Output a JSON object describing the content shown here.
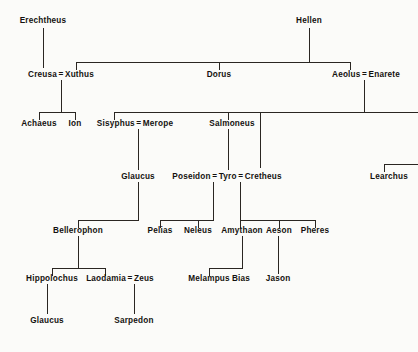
{
  "diagram": {
    "type": "family-tree",
    "ink_color": "#2a2622",
    "paper_color": "#fbfbf9",
    "union_symbol": "=",
    "generations": [
      {
        "row": 1,
        "y": 22,
        "people": [
          {
            "name": "Erechtheus",
            "x": 43
          },
          {
            "name": "Hellen",
            "x": 309
          }
        ]
      },
      {
        "row": 2,
        "y": 76,
        "people": [
          {
            "name": "Creusa",
            "x": 46
          },
          {
            "name": "Xuthus",
            "x": 76
          },
          {
            "name": "Dorus",
            "x": 219
          },
          {
            "name": "Aeolus",
            "x": 350
          },
          {
            "name": "Enarete",
            "x": 383
          }
        ],
        "unions": [
          {
            "left": "Creusa",
            "right": "Xuthus"
          },
          {
            "left": "Aeolus",
            "right": "Enarete"
          }
        ]
      },
      {
        "row": 3,
        "y": 125,
        "people": [
          {
            "name": "Achaeus",
            "x": 39
          },
          {
            "name": "Ion",
            "x": 75
          },
          {
            "name": "Sisyphus",
            "x": 114
          },
          {
            "name": "Merope",
            "x": 153
          },
          {
            "name": "Salmoneus",
            "x": 232
          }
        ],
        "unions": [
          {
            "left": "Sisyphus",
            "right": "Merope"
          }
        ]
      },
      {
        "row": 4,
        "y": 178,
        "people": [
          {
            "name": "Glaucus",
            "x": 138
          },
          {
            "name": "Poseidon",
            "x": 196
          },
          {
            "name": "Tyro",
            "x": 227
          },
          {
            "name": "Cretheus",
            "x": 256
          },
          {
            "name": "Learchus",
            "x": 389
          }
        ],
        "unions": [
          {
            "left": "Poseidon",
            "right": "Tyro"
          },
          {
            "left": "Tyro",
            "right": "Cretheus"
          }
        ]
      },
      {
        "row": 5,
        "y": 232,
        "people": [
          {
            "name": "Bellerophon",
            "x": 78
          },
          {
            "name": "Pelias",
            "x": 160
          },
          {
            "name": "Neleus",
            "x": 198
          },
          {
            "name": "Amythaon",
            "x": 242
          },
          {
            "name": "Aeson",
            "x": 279
          },
          {
            "name": "Pheres",
            "x": 315
          }
        ]
      },
      {
        "row": 6,
        "y": 280,
        "people": [
          {
            "name": "Hippolochus",
            "x": 52
          },
          {
            "name": "Laodamia",
            "x": 105
          },
          {
            "name": "Zeus",
            "x": 141
          },
          {
            "name": "Melampus",
            "x": 209
          },
          {
            "name": "Bias",
            "x": 241
          },
          {
            "name": "Jason",
            "x": 278
          }
        ],
        "unions": [
          {
            "left": "Laodamia",
            "right": "Zeus"
          }
        ]
      },
      {
        "row": 7,
        "y": 322,
        "people": [
          {
            "name": "Glaucus",
            "x": 47
          },
          {
            "name": "Sarpedon",
            "x": 134
          }
        ]
      }
    ],
    "labels": {
      "erechtheus": "Erechtheus",
      "hellen": "Hellen",
      "creusa": "Creusa",
      "xuthus": "Xuthus",
      "dorus": "Dorus",
      "aeolus": "Aeolus",
      "enarete": "Enarete",
      "achaeus": "Achaeus",
      "ion": "Ion",
      "sisyphus": "Sisyphus",
      "merope": "Merope",
      "salmoneus": "Salmoneus",
      "glaucus_mid": "Glaucus",
      "poseidon": "Poseidon",
      "tyro": "Tyro",
      "cretheus": "Cretheus",
      "learchus": "Learchus",
      "bellerophon": "Bellerophon",
      "pelias": "Pelias",
      "neleus": "Neleus",
      "amythaon": "Amythaon",
      "aeson": "Aeson",
      "pheres": "Pheres",
      "hippolochus": "Hippolochus",
      "laodamia": "Laodamia",
      "zeus": "Zeus",
      "melampus": "Melampus",
      "bias": "Bias",
      "jason": "Jason",
      "glaucus_low": "Glaucus",
      "sarpedon": "Sarpedon",
      "eq1": "=",
      "eq2": "=",
      "eq3": "=",
      "eq4": "=",
      "eq5": "=",
      "eq6": "="
    }
  }
}
